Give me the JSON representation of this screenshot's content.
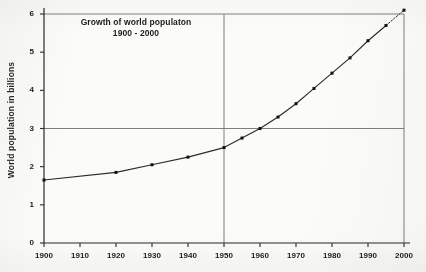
{
  "chart_data": {
    "type": "line",
    "title": "Growth of world populaton",
    "subtitle": "1900 - 2000",
    "xlabel": "",
    "ylabel": "World population in billions",
    "xlim": [
      1900,
      2000
    ],
    "ylim": [
      0,
      6
    ],
    "grid": "reference-lines-only",
    "legend": "none",
    "x_ticks": [
      1900,
      1910,
      1920,
      1930,
      1940,
      1950,
      1960,
      1970,
      1980,
      1990,
      2000
    ],
    "x_tick_labels": [
      "1900",
      "1910",
      "1920",
      "1930",
      "1940",
      "1950",
      "1960",
      "1970",
      "1980",
      "1990",
      "2000"
    ],
    "y_ticks": [
      0,
      1,
      2,
      3,
      4,
      5,
      6
    ],
    "y_tick_labels": [
      "0",
      "1",
      "2",
      "3",
      "4",
      "5",
      "6"
    ],
    "reference_lines": [
      {
        "orientation": "horizontal",
        "value": 3,
        "label": "3 billion"
      },
      {
        "orientation": "horizontal",
        "value": 6,
        "label": "6 billion"
      },
      {
        "orientation": "vertical",
        "value": 1950,
        "label": "1950"
      },
      {
        "orientation": "vertical",
        "value": 2000,
        "label": "2000"
      }
    ],
    "series": [
      {
        "name": "World population",
        "marker": "filled-square",
        "x": [
          1900,
          1920,
          1930,
          1940,
          1950,
          1955,
          1960,
          1965,
          1970,
          1975,
          1980,
          1985,
          1990,
          1995,
          2000
        ],
        "values": [
          1.65,
          1.85,
          2.05,
          2.25,
          2.5,
          2.75,
          3.0,
          3.3,
          3.65,
          4.05,
          4.45,
          4.85,
          5.3,
          5.7,
          6.1
        ],
        "projected_from": 1995
      }
    ]
  }
}
